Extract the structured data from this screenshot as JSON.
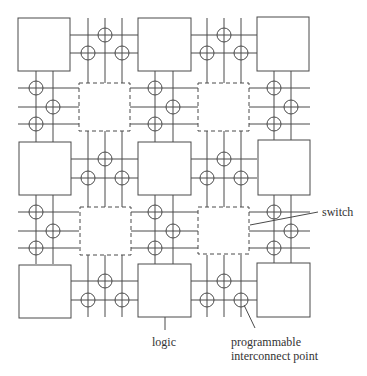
{
  "diagram": {
    "colors": {
      "stroke": "#4a4a4a",
      "background": "#ffffff",
      "text": "#333333"
    },
    "logic_blocks": [
      {
        "x": 18,
        "y": 18,
        "w": 52,
        "h": 53
      },
      {
        "x": 138,
        "y": 18,
        "w": 53,
        "h": 53
      },
      {
        "x": 257,
        "y": 17,
        "w": 52,
        "h": 54
      },
      {
        "x": 19,
        "y": 142,
        "w": 52,
        "h": 53
      },
      {
        "x": 138,
        "y": 142,
        "w": 53,
        "h": 53
      },
      {
        "x": 258,
        "y": 140,
        "w": 52,
        "h": 55
      },
      {
        "x": 19,
        "y": 265,
        "w": 52,
        "h": 53
      },
      {
        "x": 138,
        "y": 264,
        "w": 53,
        "h": 53
      },
      {
        "x": 257,
        "y": 263,
        "w": 53,
        "h": 54
      }
    ],
    "switch_boxes": [
      {
        "x": 79,
        "y": 83,
        "w": 51,
        "h": 48
      },
      {
        "x": 198,
        "y": 83,
        "w": 51,
        "h": 48
      },
      {
        "x": 80,
        "y": 207,
        "w": 51,
        "h": 48
      },
      {
        "x": 198,
        "y": 207,
        "w": 51,
        "h": 47
      }
    ],
    "labels": {
      "switch": "switch",
      "logic": "logic",
      "pip_line1": "programmable",
      "pip_line2": "interconnect point"
    }
  }
}
